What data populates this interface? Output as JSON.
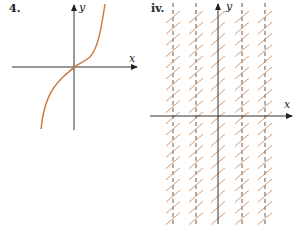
{
  "panels": [
    {
      "label": "4.",
      "x_label": "x",
      "y_label": "y",
      "description": "Graph of a cubic-like increasing curve through the origin"
    },
    {
      "label": "iv.",
      "x_label": "x",
      "y_label": "y",
      "description": "Slope field with all slopes equal to 1; dashed vertical lines"
    }
  ],
  "colors": {
    "curve": "#c8783c",
    "axis": "#333333",
    "slope": "#d49a6e",
    "dashed": "#444444"
  }
}
